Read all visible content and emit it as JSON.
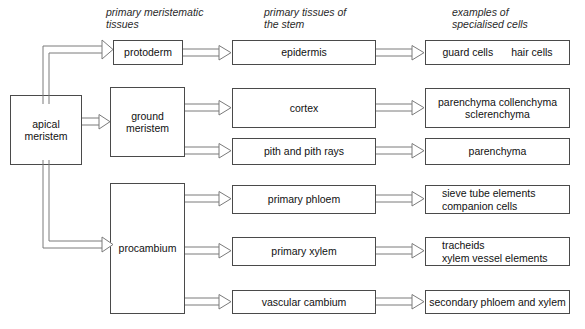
{
  "diagram": {
    "stroke_color": "#4a4a4a",
    "text_color": "#111111",
    "background": "#ffffff"
  },
  "headers": [
    {
      "id": "col-meristematic",
      "text": "primary meristematic\ntissues"
    },
    {
      "id": "col-tissues",
      "text": "primary tissues of\nthe stem"
    },
    {
      "id": "col-cells",
      "text": "examples of\nspecialised cells"
    }
  ],
  "source": {
    "label": "apical\nmeristem"
  },
  "meristematic": [
    {
      "id": "protoderm",
      "label": "protoderm"
    },
    {
      "id": "ground-meristem",
      "label": "ground\nmeristem"
    },
    {
      "id": "procambium",
      "label": "procambium"
    }
  ],
  "tissues": [
    {
      "id": "epidermis",
      "label": "epidermis"
    },
    {
      "id": "cortex",
      "label": "cortex"
    },
    {
      "id": "pith-and-pith-rays",
      "label": "pith and pith rays"
    },
    {
      "id": "primary-phloem",
      "label": "primary phloem"
    },
    {
      "id": "primary-xylem",
      "label": "primary xylem"
    },
    {
      "id": "vascular-cambium",
      "label": "vascular  cambium"
    }
  ],
  "cells": [
    {
      "id": "epidermis-cells",
      "col1": "guard cells",
      "col2": "hair cells"
    },
    {
      "id": "cortex-cells",
      "label": "parenchyma        collenchyma\nsclerenchyma"
    },
    {
      "id": "pith-cells",
      "label": "parenchyma"
    },
    {
      "id": "phloem-cells",
      "label": "sieve tube elements\ncompanion cells"
    },
    {
      "id": "xylem-cells",
      "label": "tracheids\nxylem vessel elements"
    },
    {
      "id": "cambium-cells",
      "label": "secondary phloem and xylem"
    }
  ]
}
